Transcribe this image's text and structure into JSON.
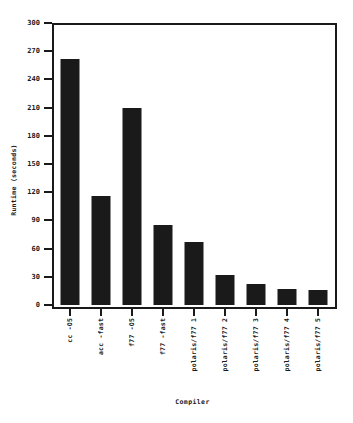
{
  "chart_data": {
    "type": "bar",
    "title": "",
    "xlabel": "Compiler",
    "ylabel": "Runtime (seconds)",
    "categories": [
      "cc -O5",
      "acc -fast",
      "f77 -O5",
      "f77 -fast",
      "polaris/f77 1",
      "polaris/f77 2",
      "polaris/f77 3",
      "polaris/f77 4",
      "polaris/f77 5"
    ],
    "values": [
      262,
      116,
      210,
      85,
      67,
      32,
      22,
      17,
      16
    ],
    "ylim": [
      0,
      300
    ],
    "yticks": [
      0,
      30,
      60,
      90,
      120,
      150,
      180,
      210,
      240,
      270,
      300
    ],
    "ytick_labels": [
      "0",
      "30",
      "60",
      "90",
      "120",
      "150",
      "180",
      "210",
      "240",
      "270",
      "300"
    ],
    "grid": false,
    "legend": false,
    "bar_color": "#1a1a1a",
    "axis_color": "#1a1a1a",
    "background_color": "#ffffff",
    "xtick_label_rotation": 90
  }
}
